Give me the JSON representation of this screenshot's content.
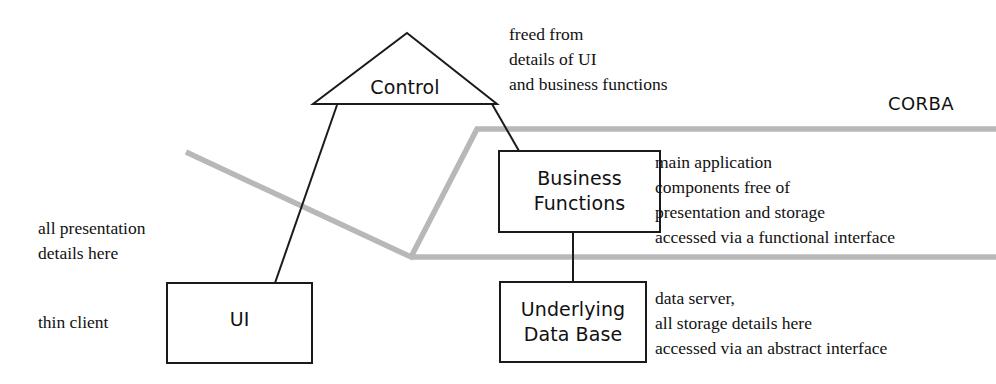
{
  "diagram": {
    "colors": {
      "stroke": "#1a1a1a",
      "bus_line": "#b8b8b8",
      "text": "#111111",
      "background": "#ffffff"
    },
    "nodes": {
      "control": {
        "label": "Control",
        "shape": "triangle"
      },
      "ui": {
        "label": "UI",
        "shape": "rectangle"
      },
      "business_functions": {
        "label": "Business\nFunctions",
        "shape": "rectangle"
      },
      "underlying_data_base": {
        "label": "Underlying\nData Base",
        "shape": "rectangle"
      }
    },
    "bus": {
      "label": "CORBA"
    },
    "annotations": {
      "control_note": "freed from\ndetails of UI\nand business functions",
      "presentation_note": "all presentation\ndetails here",
      "thin_client_note": "thin client",
      "business_note": "main application\ncomponents free of\npresentation and storage\naccessed via a functional interface",
      "database_note": "data server,\nall storage details here\naccessed via an abstract interface"
    }
  }
}
